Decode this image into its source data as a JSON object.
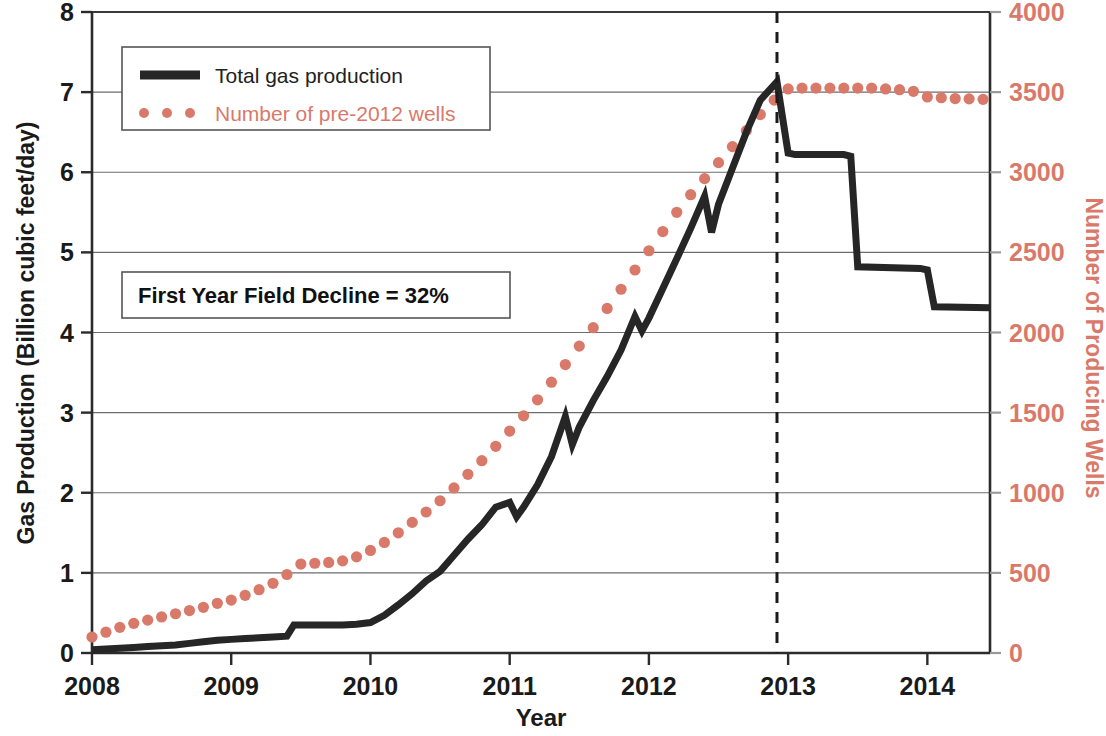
{
  "chart_data": {
    "type": "line",
    "title": "",
    "xlabel": "Year",
    "ylabel": "Gas Production (Billion cubic feet/day)",
    "y2label": "Number of Producing Wells",
    "xlim": [
      2008.0,
      2014.45
    ],
    "ylim": [
      0,
      8
    ],
    "y2lim": [
      0,
      4000
    ],
    "grid": true,
    "legend_position": "upper-left-inside",
    "x_ticks": [
      "2008",
      "2009",
      "2010",
      "2011",
      "2012",
      "2013",
      "2014"
    ],
    "x_tick_values": [
      2008,
      2009,
      2010,
      2011,
      2012,
      2013,
      2014
    ],
    "y_ticks": [
      "0",
      "1",
      "2",
      "3",
      "4",
      "5",
      "6",
      "7",
      "8"
    ],
    "y_tick_values": [
      0,
      1,
      2,
      3,
      4,
      5,
      6,
      7,
      8
    ],
    "y2_ticks": [
      "0",
      "500",
      "1000",
      "1500",
      "2000",
      "2500",
      "3000",
      "3500",
      "4000"
    ],
    "y2_tick_values": [
      0,
      500,
      1000,
      1500,
      2000,
      2500,
      3000,
      3500,
      4000
    ],
    "annotations": [
      {
        "name": "first-year-field-decline",
        "text": "First Year Field Decline = 32%",
        "x": 2008.45,
        "y": 4.42
      },
      {
        "name": "peak-marker-dashed-line",
        "type": "vline",
        "x": 2012.92,
        "style": "dashed"
      }
    ],
    "series": [
      {
        "name": "Total gas production",
        "axis": "left",
        "color": "#262626",
        "style": "solid-thick-line",
        "units": "Billion cubic feet/day",
        "x": [
          2008.0,
          2008.1,
          2008.2,
          2008.3,
          2008.4,
          2008.5,
          2008.6,
          2008.7,
          2008.8,
          2008.9,
          2009.0,
          2009.1,
          2009.2,
          2009.3,
          2009.4,
          2009.45,
          2009.5,
          2009.6,
          2009.7,
          2009.8,
          2009.9,
          2010.0,
          2010.1,
          2010.2,
          2010.3,
          2010.4,
          2010.5,
          2010.6,
          2010.7,
          2010.8,
          2010.9,
          2011.0,
          2011.05,
          2011.1,
          2011.2,
          2011.3,
          2011.4,
          2011.45,
          2011.5,
          2011.6,
          2011.7,
          2011.8,
          2011.9,
          2011.95,
          2012.0,
          2012.1,
          2012.2,
          2012.3,
          2012.4,
          2012.45,
          2012.5,
          2012.6,
          2012.7,
          2012.8,
          2012.92,
          2013.0,
          2013.05,
          2013.4,
          2013.45,
          2013.5,
          2013.95,
          2014.0,
          2014.05,
          2014.45
        ],
        "y": [
          0.04,
          0.05,
          0.06,
          0.07,
          0.08,
          0.09,
          0.1,
          0.12,
          0.14,
          0.16,
          0.17,
          0.18,
          0.19,
          0.2,
          0.21,
          0.35,
          0.35,
          0.35,
          0.35,
          0.35,
          0.36,
          0.38,
          0.47,
          0.6,
          0.74,
          0.9,
          1.02,
          1.22,
          1.42,
          1.6,
          1.82,
          1.88,
          1.7,
          1.82,
          2.1,
          2.45,
          2.95,
          2.6,
          2.82,
          3.15,
          3.45,
          3.78,
          4.2,
          4.02,
          4.18,
          4.55,
          4.92,
          5.3,
          5.7,
          5.25,
          5.6,
          6.05,
          6.5,
          6.9,
          7.13,
          6.24,
          6.22,
          6.22,
          6.2,
          4.82,
          4.8,
          4.78,
          4.32,
          4.31
        ]
      },
      {
        "name": "Number of  pre-2012 wells",
        "axis": "right",
        "color": "#d9796a",
        "style": "dotted",
        "units": "wells",
        "x": [
          2008.0,
          2008.1,
          2008.2,
          2008.3,
          2008.4,
          2008.5,
          2008.6,
          2008.7,
          2008.8,
          2008.9,
          2009.0,
          2009.1,
          2009.2,
          2009.3,
          2009.4,
          2009.5,
          2009.6,
          2009.7,
          2009.8,
          2009.9,
          2010.0,
          2010.1,
          2010.2,
          2010.3,
          2010.4,
          2010.5,
          2010.6,
          2010.7,
          2010.8,
          2010.9,
          2011.0,
          2011.1,
          2011.2,
          2011.3,
          2011.4,
          2011.5,
          2011.6,
          2011.7,
          2011.8,
          2011.9,
          2012.0,
          2012.1,
          2012.2,
          2012.3,
          2012.4,
          2012.5,
          2012.6,
          2012.7,
          2012.8,
          2012.9,
          2013.0,
          2013.1,
          2013.2,
          2013.3,
          2013.4,
          2013.5,
          2013.6,
          2013.7,
          2013.8,
          2013.9,
          2014.0,
          2014.1,
          2014.2,
          2014.3,
          2014.4
        ],
        "y": [
          100,
          130,
          160,
          185,
          205,
          225,
          245,
          265,
          285,
          310,
          330,
          360,
          395,
          435,
          490,
          555,
          560,
          565,
          575,
          600,
          640,
          690,
          750,
          815,
          880,
          950,
          1030,
          1115,
          1200,
          1290,
          1385,
          1480,
          1580,
          1690,
          1800,
          1915,
          2030,
          2150,
          2270,
          2390,
          2510,
          2630,
          2750,
          2860,
          2960,
          3060,
          3160,
          3260,
          3360,
          3450,
          3520,
          3525,
          3525,
          3525,
          3525,
          3525,
          3525,
          3520,
          3515,
          3505,
          3470,
          3465,
          3460,
          3458,
          3455
        ]
      }
    ]
  },
  "legend": {
    "name": "chart-legend",
    "items": [
      {
        "label": "Total gas production",
        "marker": "solid-line",
        "color": "#262626"
      },
      {
        "label": "Number of  pre-2012 wells",
        "marker": "dotted-line",
        "color": "#d9796a"
      }
    ]
  },
  "colors": {
    "black_series": "#262626",
    "red_series": "#d9796a",
    "gridline": "#6d6d6d",
    "background": "#ffffff"
  }
}
